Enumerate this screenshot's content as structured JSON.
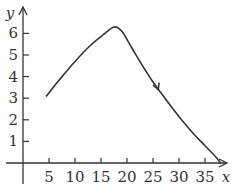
{
  "chart_data": {
    "type": "line",
    "title": "",
    "xlabel": "x",
    "ylabel": "y",
    "xlim": [
      0,
      39
    ],
    "ylim": [
      0,
      6.6
    ],
    "x_ticks": [
      5,
      10,
      15,
      20,
      25,
      30,
      35
    ],
    "y_ticks": [
      1,
      2,
      3,
      4,
      5,
      6
    ],
    "grid": false,
    "legend": "none",
    "series": [
      {
        "name": "curve",
        "x": [
          4.5,
          7,
          10,
          13,
          15.5,
          17.5,
          19,
          21,
          23,
          25,
          27,
          29,
          31,
          33,
          35,
          37,
          38
        ],
        "y": [
          3.1,
          3.85,
          4.7,
          5.45,
          5.95,
          6.3,
          6.1,
          5.3,
          4.5,
          3.75,
          3.1,
          2.45,
          1.85,
          1.3,
          0.8,
          0.3,
          0.0
        ]
      }
    ],
    "annotations": [
      {
        "type": "direction-arrow",
        "x": 26,
        "y": 3.4,
        "direction": "along-curve-decreasing"
      }
    ]
  },
  "colors": {
    "line": "#333333",
    "axis": "#333333",
    "background": "#ffffff"
  }
}
